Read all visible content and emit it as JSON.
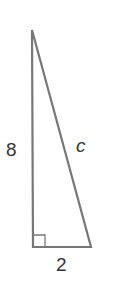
{
  "diagram": {
    "type": "right-triangle",
    "stroke_color": "#777777",
    "label_color": "#333333",
    "vertices": {
      "apex": [
        32,
        30
      ],
      "right_angle": [
        33,
        247
      ],
      "base_right": [
        91,
        247
      ]
    },
    "right_angle_marker_size": 12,
    "labels": {
      "vertical_leg": "8",
      "hypotenuse": "c",
      "horizontal_leg": "2"
    }
  }
}
